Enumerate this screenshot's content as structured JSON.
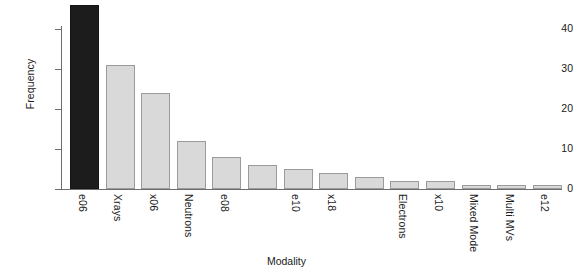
{
  "chart_data": {
    "type": "bar",
    "title": "",
    "xlabel": "Modality",
    "ylabel": "Frequency",
    "categories": [
      "e06",
      "Xrays",
      "x06",
      "Neutrons",
      "e08",
      "",
      "e10",
      "x18",
      "",
      "Electrons",
      "x10",
      "Mixed Mode",
      "Multi MVs",
      "e12"
    ],
    "values": [
      46,
      31,
      24,
      12,
      8,
      6,
      5,
      4,
      3,
      2,
      2,
      1,
      1,
      1
    ],
    "ylim": [
      0,
      47
    ],
    "yticks": [
      0,
      10,
      20,
      30,
      40
    ],
    "ytick_labels": [
      "0",
      "10",
      "20",
      "30",
      "40"
    ],
    "grid": false,
    "legend": "none",
    "bar_colors": {
      "default": "#d9d9d9",
      "highlight": "#1c1c1c",
      "border": "#9b9b9b"
    },
    "highlight_index": 0,
    "bars": [
      {
        "label": "e06",
        "value": 46,
        "highlight": true
      },
      {
        "label": "Xrays",
        "value": 31,
        "highlight": false
      },
      {
        "label": "x06",
        "value": 24,
        "highlight": false
      },
      {
        "label": "Neutrons",
        "value": 12,
        "highlight": false
      },
      {
        "label": "e08",
        "value": 8,
        "highlight": false
      },
      {
        "label": "",
        "value": 6,
        "highlight": false
      },
      {
        "label": "e10",
        "value": 5,
        "highlight": false
      },
      {
        "label": "x18",
        "value": 4,
        "highlight": false
      },
      {
        "label": "",
        "value": 3,
        "highlight": false
      },
      {
        "label": "Electrons",
        "value": 2,
        "highlight": false
      },
      {
        "label": "x10",
        "value": 2,
        "highlight": false
      },
      {
        "label": "Mixed Mode",
        "value": 1,
        "highlight": false
      },
      {
        "label": "Multi MVs",
        "value": 1,
        "highlight": false
      },
      {
        "label": "e12",
        "value": 1,
        "highlight": false
      }
    ]
  },
  "axes": {
    "y_title": "Frequency",
    "x_title": "Modality"
  }
}
